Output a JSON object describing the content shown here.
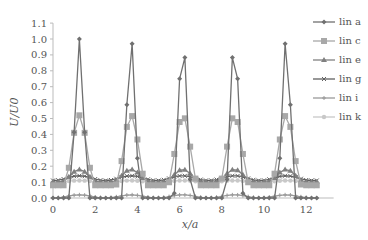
{
  "chart_data": {
    "type": "line",
    "title": "",
    "xlabel": "x/a",
    "ylabel": "U/U0",
    "xlim": [
      0,
      13
    ],
    "ylim": [
      0,
      1.1
    ],
    "xticks": [
      "0",
      "2",
      "4",
      "6",
      "8",
      "10",
      "12"
    ],
    "yticks": [
      "0.0",
      "0.1",
      "0.2",
      "0.3",
      "0.4",
      "0.5",
      "0.6",
      "0.7",
      "0.8",
      "0.9",
      "1.0",
      "1.1"
    ],
    "grid": false,
    "legend_position": "right",
    "peak_x": [
      1.25,
      3.7,
      6.15,
      8.6,
      11.05
    ],
    "series": [
      {
        "name": "lin a",
        "color": "#707070",
        "marker": "diamond",
        "peak": 1.0,
        "base": 0.0,
        "halfwidth": 0.45
      },
      {
        "name": "lin c",
        "color": "#a8a8a8",
        "marker": "square",
        "peak": 0.52,
        "base": 0.08,
        "halfwidth": 0.75
      },
      {
        "name": "lin e",
        "color": "#808080",
        "marker": "triangle",
        "peak": 0.18,
        "base": 0.1,
        "halfwidth": 0.9
      },
      {
        "name": "lin g",
        "color": "#606060",
        "marker": "cross",
        "peak": 0.14,
        "base": 0.11,
        "halfwidth": 1.2
      },
      {
        "name": "lin i",
        "color": "#999999",
        "marker": "plus",
        "peak": 0.02,
        "base": 0.0,
        "halfwidth": 1.2
      },
      {
        "name": "lin k",
        "color": "#c8c8c8",
        "marker": "circle",
        "peak": 0.11,
        "base": 0.1,
        "halfwidth": 1.2
      }
    ]
  },
  "legend": {
    "items": [
      "lin a",
      "lin c",
      "lin e",
      "lin g",
      "lin i",
      "lin k"
    ]
  }
}
